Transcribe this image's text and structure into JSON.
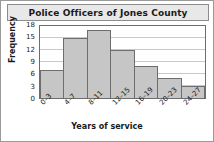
{
  "chart_data": {
    "type": "bar",
    "title": "Police Officers of Jones County",
    "xlabel": "Years of service",
    "ylabel": "Frequency",
    "categories": [
      "0–3",
      "4–7",
      "8–11",
      "12–15",
      "16–19",
      "20–23",
      "24–27"
    ],
    "values": [
      7,
      15,
      17,
      12,
      8,
      5,
      3
    ],
    "ylim": [
      0,
      18
    ],
    "yticks": [
      0,
      3,
      6,
      9,
      12,
      15,
      18
    ],
    "grid": true,
    "legend": false,
    "bar_color": "#c6c6c6",
    "bar_edge_color": "#6d6d6d",
    "title_band_color": "#e8e8e8",
    "frame_color": "#9a9a9a"
  }
}
